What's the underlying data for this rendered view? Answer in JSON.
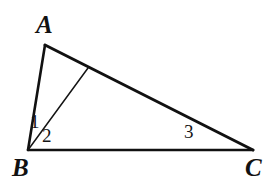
{
  "figure": {
    "kind": "geometry-diagram",
    "background_color": "#ffffff",
    "stroke_color": "#111111",
    "vertices": [
      {
        "name": "A",
        "label": "A",
        "x": 45,
        "y": 45
      },
      {
        "name": "B",
        "label": "B",
        "x": 28,
        "y": 150
      },
      {
        "name": "C",
        "label": "C",
        "x": 253,
        "y": 150
      }
    ],
    "cevian_foot": {
      "name": "D",
      "x": 88,
      "y": 68
    },
    "segments": [
      {
        "name": "side-AB",
        "from": "A",
        "to": "B",
        "width": 2.6
      },
      {
        "name": "side-AC",
        "from": "A",
        "to": "C",
        "width": 3.0
      },
      {
        "name": "side-BC",
        "from": "B",
        "to": "C",
        "width": 2.6
      },
      {
        "name": "cevian-BD",
        "from": "B",
        "to": "D",
        "width": 1.5
      }
    ],
    "vertex_labels": {
      "a": "A",
      "b": "B",
      "c": "C"
    },
    "angle_labels": {
      "one": "1",
      "two": "2",
      "three": "3"
    }
  }
}
